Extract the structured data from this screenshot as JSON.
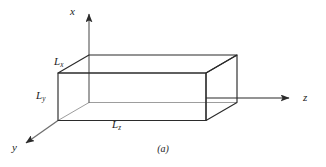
{
  "figure": {
    "caption": "(a)",
    "type": "3d-rectangular-box-diagram",
    "stroke_color": "#2b2b2b",
    "hidden_edge_color": "#9a9a9a",
    "background_color": "#ffffff",
    "axes": [
      {
        "name": "x-axis",
        "label": "x",
        "direction": "up"
      },
      {
        "name": "y-axis",
        "label": "y",
        "direction": "down-left"
      },
      {
        "name": "z-axis",
        "label": "z",
        "direction": "right"
      }
    ],
    "axis_labels": {
      "x": "x",
      "y": "y",
      "z": "z"
    },
    "dimension_labels": [
      {
        "name": "Lx",
        "base": "L",
        "subscript": "x"
      },
      {
        "name": "Ly",
        "base": "L",
        "subscript": "y"
      },
      {
        "name": "Lz",
        "base": "L",
        "subscript": "z"
      }
    ],
    "dimensions": {
      "Lx": {
        "base": "L",
        "subscript": "x"
      },
      "Ly": {
        "base": "L",
        "subscript": "y"
      },
      "Lz": {
        "base": "L",
        "subscript": "z"
      }
    }
  }
}
